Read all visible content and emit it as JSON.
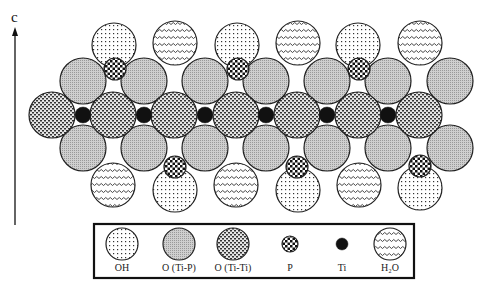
{
  "figure": {
    "axis": {
      "label": "c",
      "x": 15,
      "y_top": 28,
      "y_bottom": 225
    },
    "atoms": [
      {
        "type": "OH",
        "x": 114,
        "y": 45
      },
      {
        "type": "H2O",
        "x": 175,
        "y": 43
      },
      {
        "type": "OH",
        "x": 237,
        "y": 45
      },
      {
        "type": "H2O",
        "x": 298,
        "y": 43
      },
      {
        "type": "OH",
        "x": 358,
        "y": 45
      },
      {
        "type": "H2O",
        "x": 420,
        "y": 43
      },
      {
        "type": "OTiP",
        "x": 83,
        "y": 81
      },
      {
        "type": "OTiP",
        "x": 144,
        "y": 81
      },
      {
        "type": "OTiP",
        "x": 205,
        "y": 81
      },
      {
        "type": "OTiP",
        "x": 266,
        "y": 81
      },
      {
        "type": "OTiP",
        "x": 327,
        "y": 81
      },
      {
        "type": "OTiP",
        "x": 388,
        "y": 81
      },
      {
        "type": "OTiP",
        "x": 450,
        "y": 81
      },
      {
        "type": "P",
        "x": 115,
        "y": 69
      },
      {
        "type": "P",
        "x": 238,
        "y": 69
      },
      {
        "type": "P",
        "x": 359,
        "y": 69
      },
      {
        "type": "OTiTi",
        "x": 52,
        "y": 115
      },
      {
        "type": "OTiTi",
        "x": 113,
        "y": 115
      },
      {
        "type": "OTiTi",
        "x": 174,
        "y": 115
      },
      {
        "type": "OTiTi",
        "x": 236,
        "y": 115
      },
      {
        "type": "OTiTi",
        "x": 297,
        "y": 115
      },
      {
        "type": "OTiTi",
        "x": 358,
        "y": 115
      },
      {
        "type": "OTiTi",
        "x": 419,
        "y": 115
      },
      {
        "type": "Ti",
        "x": 83,
        "y": 115
      },
      {
        "type": "Ti",
        "x": 144,
        "y": 115
      },
      {
        "type": "Ti",
        "x": 205,
        "y": 115
      },
      {
        "type": "Ti",
        "x": 266,
        "y": 115
      },
      {
        "type": "Ti",
        "x": 327,
        "y": 115
      },
      {
        "type": "Ti",
        "x": 388,
        "y": 115
      },
      {
        "type": "OTiP",
        "x": 83,
        "y": 148
      },
      {
        "type": "OTiP",
        "x": 144,
        "y": 148
      },
      {
        "type": "OTiP",
        "x": 205,
        "y": 148
      },
      {
        "type": "OTiP",
        "x": 266,
        "y": 148
      },
      {
        "type": "OTiP",
        "x": 327,
        "y": 148
      },
      {
        "type": "OTiP",
        "x": 388,
        "y": 148
      },
      {
        "type": "OTiP",
        "x": 450,
        "y": 148
      },
      {
        "type": "H2O",
        "x": 113,
        "y": 185
      },
      {
        "type": "OH",
        "x": 175,
        "y": 190
      },
      {
        "type": "H2O",
        "x": 236,
        "y": 185
      },
      {
        "type": "OH",
        "x": 298,
        "y": 190
      },
      {
        "type": "H2O",
        "x": 359,
        "y": 185
      },
      {
        "type": "OH",
        "x": 420,
        "y": 188
      },
      {
        "type": "P",
        "x": 175,
        "y": 167
      },
      {
        "type": "P",
        "x": 297,
        "y": 167
      },
      {
        "type": "P",
        "x": 420,
        "y": 166
      }
    ],
    "radii": {
      "OH": 22,
      "H2O": 22,
      "OTiP": 23,
      "OTiTi": 23,
      "P": 11,
      "Ti": 8
    }
  },
  "legend": {
    "box": {
      "x": 94,
      "y": 224,
      "width": 320,
      "height": 54
    },
    "items": [
      {
        "type": "OH",
        "label": "OH",
        "x": 122,
        "r": 16
      },
      {
        "type": "OTiP",
        "label": "O (Ti-P)",
        "x": 179,
        "r": 16
      },
      {
        "type": "OTiTi",
        "label": "O (Ti-Ti)",
        "x": 233,
        "r": 16
      },
      {
        "type": "P",
        "label": "P",
        "x": 290,
        "r": 8
      },
      {
        "type": "Ti",
        "label": "Ti",
        "x": 342,
        "r": 6
      },
      {
        "type": "H2O",
        "label": "H₂O",
        "x": 390,
        "r": 16
      }
    ],
    "circle_y": 244,
    "label_y": 271
  }
}
